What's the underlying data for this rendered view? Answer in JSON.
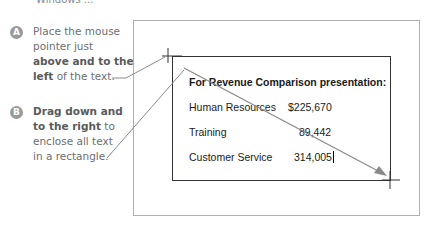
{
  "top_fragment": "Windows ...",
  "callouts": [
    {
      "badge": "A",
      "lines": [
        {
          "text": "Place the mouse",
          "bold": false
        },
        {
          "text": "pointer just",
          "bold": false
        },
        {
          "text": "above and to the",
          "bold": true
        },
        {
          "text_bold": "left",
          "text_rest": " of the text."
        }
      ]
    },
    {
      "badge": "B",
      "lines": [
        {
          "text": "Drag down and",
          "bold": true
        },
        {
          "text_bold": "to the right",
          "text_rest": " to"
        },
        {
          "text": "enclose all text",
          "bold": false
        },
        {
          "text": "in a rectangle.",
          "bold": false
        }
      ]
    }
  ],
  "document": {
    "title": "For Revenue Comparison presentation:",
    "rows": [
      {
        "label": "Human Resources",
        "value": "$225,670"
      },
      {
        "label": "Training",
        "value": "89,442"
      },
      {
        "label": "Customer Service",
        "value": "314,005"
      }
    ]
  },
  "icons": {
    "start_cursor": "crosshair-icon",
    "end_cursor": "crosshair-icon",
    "drag_arrow": "arrow-icon"
  },
  "colors": {
    "callout_text": "#6e6e6e",
    "badge": "#9a9a9a",
    "frame_border": "#b0b0b0",
    "selection_border": "#333333",
    "arrow": "#8a8a8a"
  }
}
